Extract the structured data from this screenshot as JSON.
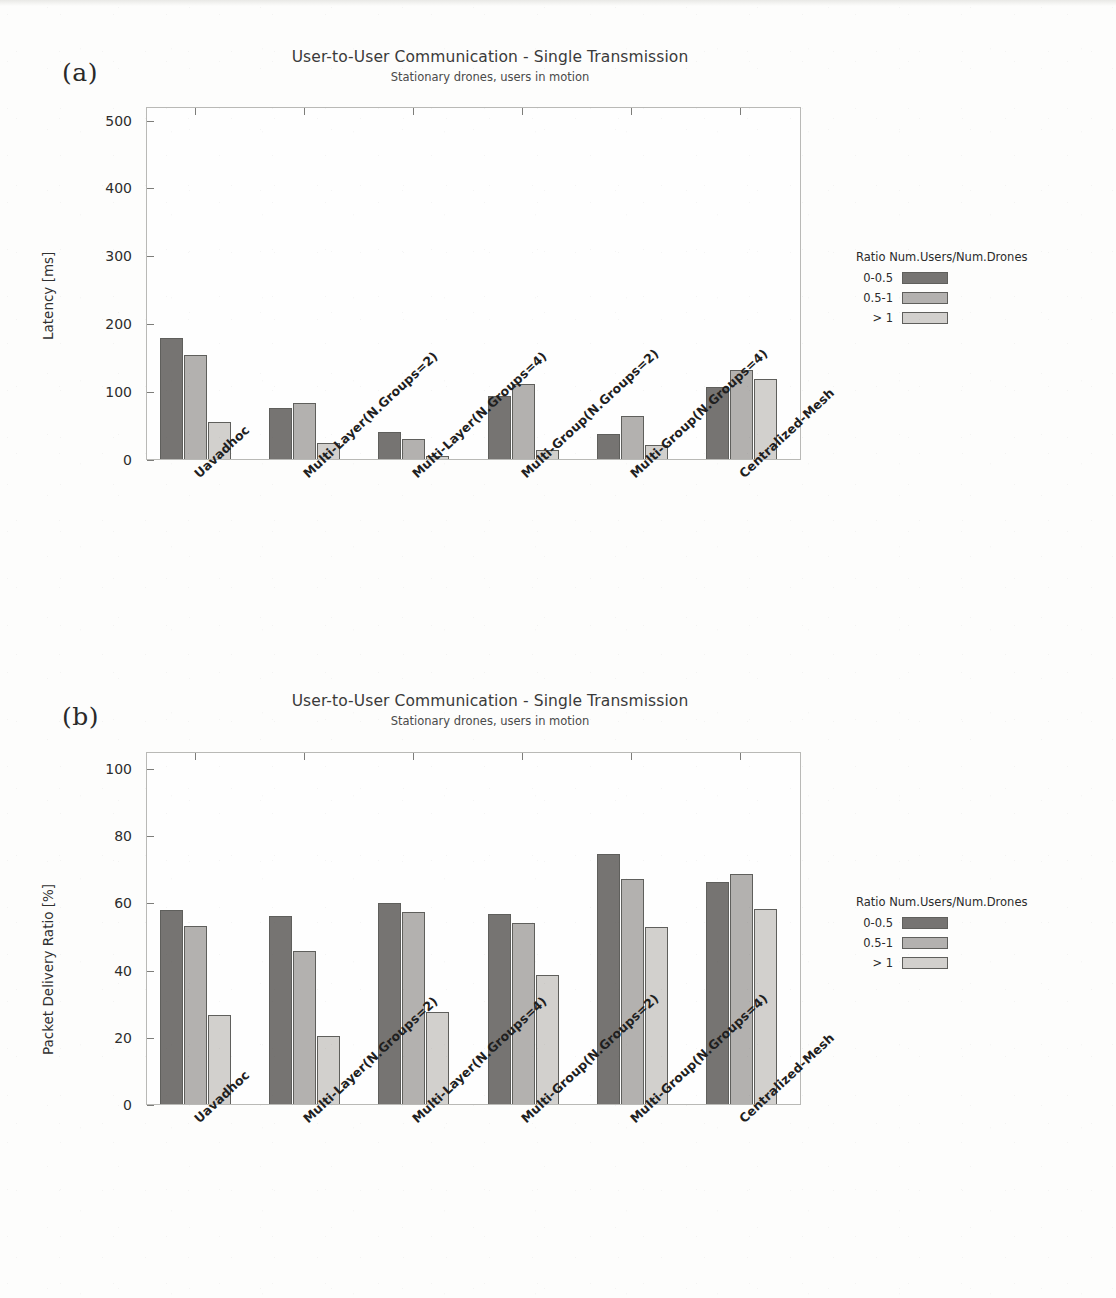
{
  "figure": {
    "panels": [
      {
        "letter": "(a)",
        "title": "User-to-User Communication - Single Transmission",
        "subtitle": "Stationary drones, users in motion"
      },
      {
        "letter": "(b)",
        "title": "User-to-User Communication - Single Transmission",
        "subtitle": "Stationary drones, users in motion"
      }
    ],
    "legend": {
      "title": "Ratio Num.Users/Num.Drones",
      "entries": [
        {
          "label": "0-0.5",
          "color": "#767472"
        },
        {
          "label": "0.5-1",
          "color": "#b3b1af"
        },
        {
          "label": "> 1",
          "color": "#d2d0cd"
        }
      ]
    }
  },
  "chart_data": [
    {
      "type": "bar",
      "panel": "(a)",
      "title": "User-to-User Communication - Single Transmission",
      "subtitle": "Stationary drones, users in motion",
      "xlabel": "",
      "ylabel": "Latency [ms]",
      "ylim": [
        0,
        520
      ],
      "yticks": [
        0,
        100,
        200,
        300,
        400,
        500
      ],
      "ytick_labels": [
        "0",
        "100",
        "200",
        "300",
        "400",
        "500"
      ],
      "grid": false,
      "legend_position": "right",
      "categories": [
        "Uavadhoc",
        "Multi-Layer(N.Groups=2)",
        "Multi-Layer(N.Groups=4)",
        "Multi-Group(N.Groups=2)",
        "Multi-Group(N.Groups=4)",
        "Centralized-Mesh"
      ],
      "series": [
        {
          "name": "0-0.5",
          "color": "#767472",
          "values": [
            178,
            75,
            40,
            93,
            37,
            106
          ]
        },
        {
          "name": "0.5-1",
          "color": "#b3b1af",
          "values": [
            153,
            82,
            29,
            111,
            64,
            131
          ]
        },
        {
          "name": "> 1",
          "color": "#d2d0cd",
          "values": [
            55,
            23,
            4,
            13,
            20,
            118
          ]
        }
      ]
    },
    {
      "type": "bar",
      "panel": "(b)",
      "title": "User-to-User Communication - Single Transmission",
      "subtitle": "Stationary drones, users in motion",
      "xlabel": "",
      "ylabel": "Packet Delivery Ratio [%]",
      "ylim": [
        0,
        105
      ],
      "yticks": [
        0,
        20,
        40,
        60,
        80,
        100
      ],
      "ytick_labels": [
        "0",
        "20",
        "40",
        "60",
        "80",
        "100"
      ],
      "grid": false,
      "legend_position": "right",
      "categories": [
        "Uavadhoc",
        "Multi-Layer(N.Groups=2)",
        "Multi-Layer(N.Groups=4)",
        "Multi-Group(N.Groups=2)",
        "Multi-Group(N.Groups=4)",
        "Centralized-Mesh"
      ],
      "series": [
        {
          "name": "0-0.5",
          "color": "#767472",
          "values": [
            57.7,
            55.8,
            59.9,
            56.4,
            74.5,
            66.0
          ]
        },
        {
          "name": "0.5-1",
          "color": "#b3b1af",
          "values": [
            52.9,
            45.6,
            57.2,
            53.8,
            66.8,
            68.4
          ]
        },
        {
          "name": "> 1",
          "color": "#d2d0cd",
          "values": [
            26.6,
            20.3,
            27.5,
            38.3,
            52.7,
            58.1
          ]
        }
      ]
    }
  ]
}
